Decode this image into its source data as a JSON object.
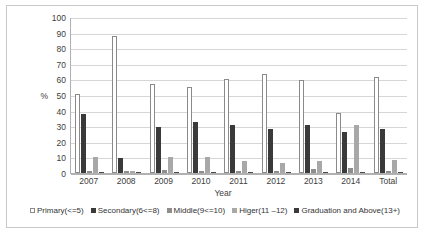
{
  "chart_data": {
    "type": "bar",
    "title": "",
    "xlabel": "Year",
    "ylabel": "%",
    "ylim": [
      0,
      100
    ],
    "yticks": [
      0,
      10,
      20,
      30,
      40,
      50,
      60,
      70,
      80,
      90,
      100
    ],
    "grid": true,
    "legend_position": "bottom",
    "categories": [
      "2007",
      "2008",
      "2009",
      "2010",
      "2011",
      "2012",
      "2013",
      "2014",
      "Total"
    ],
    "series": [
      {
        "name": "Primary(<=5)",
        "color": "#ffffff",
        "values": [
          50.5,
          88,
          57,
          55,
          60.5,
          63.5,
          59.5,
          38.5,
          61.5
        ]
      },
      {
        "name": "Secondary(6<=8)",
        "color": "#3a3a3a",
        "values": [
          38,
          9.5,
          29.5,
          32.5,
          31,
          28,
          31,
          26.5,
          28
        ]
      },
      {
        "name": "Middle(9<=10)",
        "color": "#8e8e8e",
        "values": [
          1.5,
          1,
          2,
          1.5,
          1,
          1,
          2.5,
          3,
          1.5
        ]
      },
      {
        "name": "Higer(11 –12)",
        "color": "#a8a8a8",
        "values": [
          10,
          1,
          10.5,
          10.5,
          7.5,
          6.5,
          7.5,
          30.5,
          8.5
        ]
      },
      {
        "name": "Graduation and Above(13+)",
        "color": "#3a3a3a",
        "values": [
          0.8,
          0.6,
          0.8,
          0.8,
          0.8,
          0.8,
          0.8,
          0.8,
          0.8
        ]
      }
    ]
  }
}
